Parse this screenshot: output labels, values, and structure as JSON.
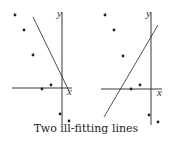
{
  "caption": "Two ill-fitting lines",
  "axis_labels": {
    "x": "x",
    "y": "y"
  },
  "colors": {
    "ink": "#222222",
    "background": "#ffffff"
  },
  "panels": [
    {
      "name": "left",
      "points": [
        [
          15,
          15
        ],
        [
          24,
          30
        ],
        [
          33,
          55
        ],
        [
          42,
          89
        ],
        [
          51,
          85
        ],
        [
          60,
          114
        ],
        [
          69,
          121
        ]
      ],
      "y_axis": {
        "x": 62,
        "y1": 12,
        "y2": 125
      },
      "x_axis": {
        "y": 88,
        "x1": 12,
        "x2": 72
      },
      "line": {
        "x1": 33,
        "y1": 17,
        "x2": 69,
        "y2": 91
      },
      "y_label_pos": [
        57,
        17
      ],
      "x_label_pos": [
        67,
        95
      ]
    },
    {
      "name": "right",
      "points": [
        [
          105,
          15
        ],
        [
          114,
          30
        ],
        [
          123,
          56
        ],
        [
          131,
          89
        ],
        [
          140,
          85
        ],
        [
          149,
          115
        ],
        [
          158,
          122
        ]
      ],
      "y_axis": {
        "x": 151,
        "y1": 12,
        "y2": 125
      },
      "x_axis": {
        "y": 89,
        "x1": 101,
        "x2": 162
      },
      "line": {
        "x1": 104,
        "y1": 117,
        "x2": 158,
        "y2": 25
      },
      "y_label_pos": [
        146,
        17
      ],
      "x_label_pos": [
        157,
        96
      ]
    }
  ],
  "chart_data": {
    "type": "scatter",
    "title": "Two ill-fitting lines",
    "xlabel": "x",
    "ylabel": "y",
    "series": [
      {
        "name": "data points (same in both panels)",
        "values": "7 points: 3 in upper-left quadrant descending, 2 near x-axis left of origin, 2 below x-axis near y-axis"
      },
      {
        "name": "left panel fit line",
        "values": "steep negative slope"
      },
      {
        "name": "right panel fit line",
        "values": "positive slope"
      }
    ]
  }
}
